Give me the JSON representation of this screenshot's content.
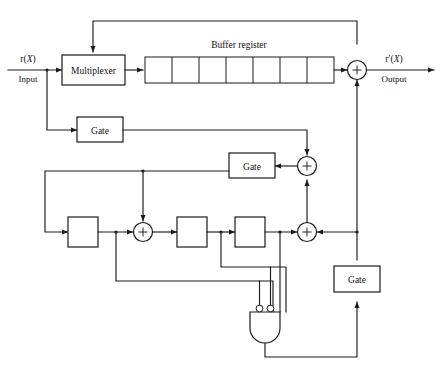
{
  "figure": {
    "type": "block-diagram",
    "background_color": "#ffffff",
    "line_color": "#1a1a1a"
  },
  "signals": {
    "input": {
      "symbol": "r(X)",
      "symbol_base": "r(",
      "symbol_var": "X",
      "symbol_close": ")",
      "caption": "Input"
    },
    "output": {
      "symbol": "r′(X)",
      "symbol_base": "r′(",
      "symbol_var": "X",
      "symbol_close": ")",
      "caption": "Output"
    }
  },
  "blocks": {
    "multiplexer": {
      "label": "Multiplexer"
    },
    "buffer_register": {
      "label": "Buffer register",
      "cell_count": 7,
      "cells": [
        "",
        "",
        "",
        "",
        "",
        "",
        ""
      ]
    },
    "gates": [
      {
        "id": "gate-input",
        "label": "Gate"
      },
      {
        "id": "gate-syndrome",
        "label": "Gate"
      },
      {
        "id": "gate-correction",
        "label": "Gate"
      }
    ],
    "shift_registers": [
      {
        "id": "stage-1",
        "label": ""
      },
      {
        "id": "stage-2",
        "label": ""
      },
      {
        "id": "stage-3",
        "label": ""
      }
    ],
    "adders": [
      {
        "id": "adder-output",
        "symbol": "+"
      },
      {
        "id": "adder-upper",
        "symbol": "+"
      },
      {
        "id": "adder-middle",
        "symbol": "+"
      },
      {
        "id": "adder-right",
        "symbol": "+"
      }
    ],
    "logic_gate": {
      "id": "and-gate",
      "type": "and",
      "label": "",
      "inverted_inputs": 2,
      "total_inputs": 3
    }
  },
  "caption": {
    "text": ""
  }
}
